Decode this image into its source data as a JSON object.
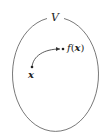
{
  "diagram": {
    "set_label": "V",
    "point_label": "x",
    "image_label_f": "f",
    "image_label_open": "(",
    "image_label_x": "x",
    "image_label_close": ")",
    "colors": {
      "stroke": "#333333",
      "text": "#222222",
      "background": "#ffffff"
    }
  }
}
